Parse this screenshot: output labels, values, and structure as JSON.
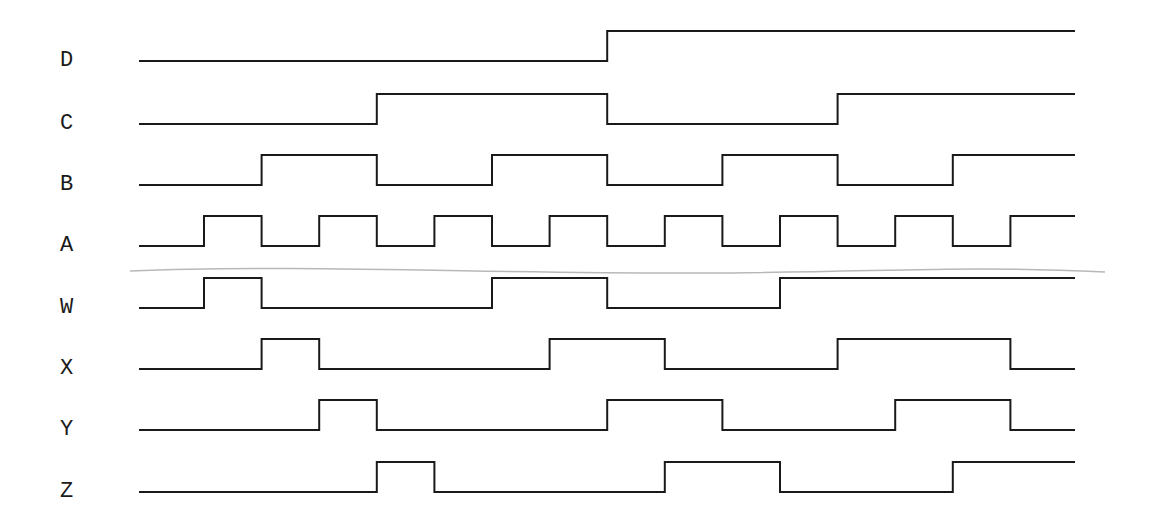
{
  "diagram": {
    "type": "timing-diagram",
    "slot_count": 16,
    "groups": [
      {
        "name": "inputs",
        "signals": [
          "D",
          "C",
          "B",
          "A"
        ]
      },
      {
        "name": "outputs",
        "signals": [
          "W",
          "X",
          "Y",
          "Z"
        ]
      }
    ],
    "signals": [
      {
        "label": "D",
        "levels": [
          0,
          0,
          0,
          0,
          0,
          0,
          0,
          0,
          1,
          1,
          1,
          1,
          1,
          1,
          1,
          1
        ]
      },
      {
        "label": "C",
        "levels": [
          0,
          0,
          0,
          0,
          1,
          1,
          1,
          1,
          0,
          0,
          0,
          0,
          1,
          1,
          1,
          1
        ]
      },
      {
        "label": "B",
        "levels": [
          0,
          0,
          1,
          1,
          0,
          0,
          1,
          1,
          0,
          0,
          1,
          1,
          0,
          0,
          1,
          1
        ]
      },
      {
        "label": "A",
        "levels": [
          0,
          1,
          0,
          1,
          0,
          1,
          0,
          1,
          0,
          1,
          0,
          1,
          0,
          1,
          0,
          1
        ]
      },
      {
        "label": "W",
        "levels": [
          0,
          1,
          0,
          0,
          0,
          0,
          1,
          1,
          0,
          0,
          0,
          1,
          1,
          1,
          1,
          1
        ]
      },
      {
        "label": "X",
        "levels": [
          0,
          0,
          1,
          0,
          0,
          0,
          0,
          1,
          1,
          0,
          0,
          0,
          1,
          1,
          1,
          0
        ]
      },
      {
        "label": "Y",
        "levels": [
          0,
          0,
          0,
          1,
          0,
          0,
          0,
          0,
          1,
          1,
          0,
          0,
          0,
          1,
          1,
          0
        ]
      },
      {
        "label": "Z",
        "levels": [
          0,
          0,
          0,
          0,
          1,
          0,
          0,
          0,
          0,
          1,
          1,
          0,
          0,
          0,
          1,
          1
        ]
      }
    ],
    "colors": {
      "wave": "#1a1a1a",
      "separator": "#b8b8b8",
      "background": "#ffffff"
    }
  }
}
